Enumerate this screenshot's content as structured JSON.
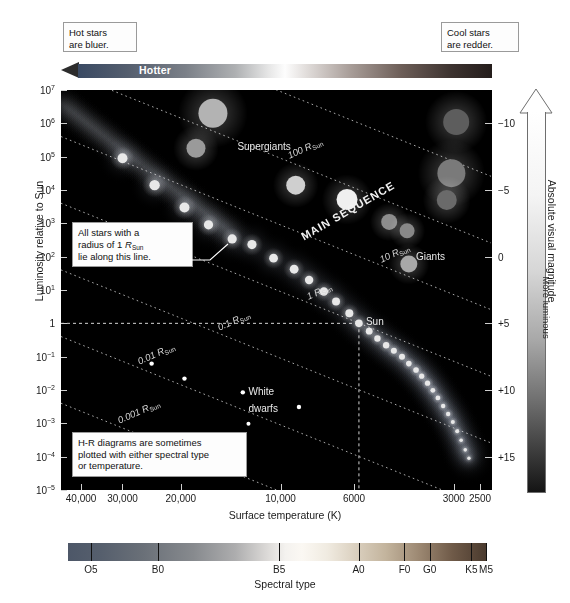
{
  "figure": {
    "kind": "hertzsprung-russell-diagram"
  },
  "annotations": {
    "hot_note": "Hot stars are blue",
    "hot_note_line1": "Hot stars",
    "hot_note_line2": "are bluer.",
    "cool_note_line1": "Cool stars",
    "cool_note_line2": "are redder.",
    "radius_note_line1": "All stars with a",
    "radius_note_line2_a": "radius of 1 ",
    "radius_note_line2_b": "R",
    "radius_note_line2_c": "Sun",
    "radius_note_line3": "lie along this line.",
    "spectral_note_line1": "H-R diagrams are sometimes",
    "spectral_note_line2": "plotted with either spectral type",
    "spectral_note_line3": "or temperature.",
    "hotter_label": "Hotter",
    "more_luminous_label": "More luminous"
  },
  "chart_data": {
    "type": "scatter",
    "xlabel": "Surface temperature (K)",
    "ylabel": "Luminosity relative to Sun",
    "y2label": "Absolute visual magnitude",
    "x_scale": "log-reversed",
    "y_scale": "log",
    "xlim": [
      46000,
      2300
    ],
    "ylim": [
      1e-05,
      10000000.0
    ],
    "grid": false,
    "x_ticks": [
      {
        "value": 40000,
        "label": "40,000"
      },
      {
        "value": 30000,
        "label": "30,000"
      },
      {
        "value": 20000,
        "label": "20,000"
      },
      {
        "value": 10000,
        "label": "10,000"
      },
      {
        "value": 6000,
        "label": "6000"
      },
      {
        "value": 3000,
        "label": "3000"
      },
      {
        "value": 2500,
        "label": "2500"
      }
    ],
    "y_ticks": [
      {
        "value": 10000000.0,
        "mant": "10",
        "exp": "7"
      },
      {
        "value": 1000000.0,
        "mant": "10",
        "exp": "6"
      },
      {
        "value": 100000.0,
        "mant": "10",
        "exp": "5"
      },
      {
        "value": 10000.0,
        "mant": "10",
        "exp": "4"
      },
      {
        "value": 1000.0,
        "mant": "10",
        "exp": "3"
      },
      {
        "value": 100.0,
        "mant": "10",
        "exp": "2"
      },
      {
        "value": 10.0,
        "mant": "10",
        "exp": "1"
      },
      {
        "value": 1,
        "mant": "1",
        "exp": ""
      },
      {
        "value": 0.1,
        "mant": "10",
        "exp": "−1"
      },
      {
        "value": 0.01,
        "mant": "10",
        "exp": "−2"
      },
      {
        "value": 0.001,
        "mant": "10",
        "exp": "−3"
      },
      {
        "value": 0.0001,
        "mant": "10",
        "exp": "−4"
      },
      {
        "value": 1e-05,
        "mant": "10",
        "exp": "−5"
      }
    ],
    "y2_ticks": [
      {
        "label": "−10",
        "lum": 1000000
      },
      {
        "label": "−5",
        "lum": 10000
      },
      {
        "label": "0",
        "lum": 100
      },
      {
        "label": "+5",
        "lum": 1
      },
      {
        "label": "+10",
        "lum": 0.01
      },
      {
        "label": "+15",
        "lum": 0.0001
      }
    ],
    "spectral_types": [
      {
        "label": "O5",
        "pos": 0.055
      },
      {
        "label": "B0",
        "pos": 0.215
      },
      {
        "label": "B5",
        "pos": 0.505
      },
      {
        "label": "A0",
        "pos": 0.695
      },
      {
        "label": "F0",
        "pos": 0.805
      },
      {
        "label": "G0",
        "pos": 0.865
      },
      {
        "label": "K5",
        "pos": 0.965
      },
      {
        "label": "M5",
        "pos": 1.0
      }
    ],
    "spectral_axis_label": "Spectral type",
    "radius_lines": [
      {
        "label": "1000",
        "unit": "R",
        "sub": "Sun",
        "radius": 1000
      },
      {
        "label": "100",
        "unit": "R",
        "sub": "Sun",
        "radius": 100
      },
      {
        "label": "10",
        "unit": "R",
        "sub": "Sun",
        "radius": 10
      },
      {
        "label": "1",
        "unit": "R",
        "sub": "Sun",
        "radius": 1
      },
      {
        "label": "0.1",
        "unit": "R",
        "sub": "Sun",
        "radius": 0.1
      },
      {
        "label": "0.01",
        "unit": "R",
        "sub": "Sun",
        "radius": 0.01
      },
      {
        "label": "0.001",
        "unit": "R",
        "sub": "Sun",
        "radius": 0.001
      }
    ],
    "region_labels": [
      {
        "name": "Supergiants",
        "temp": 13500,
        "lum": 300000
      },
      {
        "name": "Giants",
        "temp": 3900,
        "lum": 150
      },
      {
        "name": "White dwarfs_1",
        "text": "White",
        "temp": 12500,
        "lum": 0.013
      },
      {
        "name": "White dwarfs_2",
        "text": "dwarfs",
        "temp": 12500,
        "lum": 0.0042
      },
      {
        "name": "MAIN SEQUENCE",
        "temp": 8600,
        "lum": 600
      }
    ],
    "sun": {
      "label": "Sun",
      "temp": 5800,
      "lum": 1,
      "magnitude": 4.8
    },
    "series": [
      {
        "name": "supergiants",
        "color": "#b9b9b9",
        "points": [
          {
            "temp": 16000,
            "lum": 2000000,
            "r": 14.5,
            "c": "#b3b3b3"
          },
          {
            "temp": 18000,
            "lum": 180000,
            "r": 9.5,
            "c": "#9a9a9a"
          },
          {
            "temp": 2950,
            "lum": 1100000,
            "r": 13.0,
            "c": "#5d5d5d"
          },
          {
            "temp": 3050,
            "lum": 32000,
            "r": 14.0,
            "c": "#7a7a7a"
          },
          {
            "temp": 3150,
            "lum": 5000,
            "r": 10.0,
            "c": "#6a6a6a"
          },
          {
            "temp": 9000,
            "lum": 14000,
            "r": 9.5,
            "c": "#cfcfcf"
          },
          {
            "temp": 6300,
            "lum": 5200,
            "r": 10.5,
            "c": "#efefef"
          }
        ]
      },
      {
        "name": "giants",
        "color": "#9c9c9c",
        "points": [
          {
            "temp": 4700,
            "lum": 1100,
            "r": 8.0,
            "c": "#8d8d8d"
          },
          {
            "temp": 4150,
            "lum": 600,
            "r": 7.5,
            "c": "#888888"
          },
          {
            "temp": 4100,
            "lum": 60,
            "r": 8.5,
            "c": "#a8a8a8"
          }
        ]
      },
      {
        "name": "main-sequence",
        "color": "#e8e8e8",
        "points": [
          {
            "temp": 30000,
            "lum": 90000,
            "r": 5.0
          },
          {
            "temp": 24000,
            "lum": 14000,
            "r": 5.2
          },
          {
            "temp": 19500,
            "lum": 3000,
            "r": 5.0
          },
          {
            "temp": 16500,
            "lum": 900,
            "r": 4.6
          },
          {
            "temp": 14000,
            "lum": 340,
            "r": 4.6
          },
          {
            "temp": 12200,
            "lum": 230,
            "r": 4.6
          },
          {
            "temp": 10500,
            "lum": 90,
            "r": 4.4
          },
          {
            "temp": 9100,
            "lum": 42,
            "r": 4.4
          },
          {
            "temp": 8200,
            "lum": 20,
            "r": 4.2
          },
          {
            "temp": 7400,
            "lum": 9,
            "r": 4.2
          },
          {
            "temp": 6800,
            "lum": 4.5,
            "r": 4.0
          },
          {
            "temp": 6200,
            "lum": 2.0,
            "r": 4.0
          },
          {
            "temp": 5800,
            "lum": 1.0,
            "r": 3.8
          },
          {
            "temp": 5400,
            "lum": 0.58,
            "r": 3.4
          },
          {
            "temp": 5100,
            "lum": 0.35,
            "r": 3.2
          },
          {
            "temp": 4800,
            "lum": 0.22,
            "r": 3.2
          },
          {
            "temp": 4550,
            "lum": 0.15,
            "r": 3.0
          },
          {
            "temp": 4300,
            "lum": 0.1,
            "r": 3.0
          },
          {
            "temp": 4100,
            "lum": 0.062,
            "r": 2.8
          },
          {
            "temp": 3900,
            "lum": 0.04,
            "r": 2.8
          },
          {
            "temp": 3750,
            "lum": 0.026,
            "r": 2.6
          },
          {
            "temp": 3600,
            "lum": 0.016,
            "r": 2.6
          },
          {
            "temp": 3470,
            "lum": 0.0098,
            "r": 2.4
          },
          {
            "temp": 3350,
            "lum": 0.0058,
            "r": 2.4
          },
          {
            "temp": 3230,
            "lum": 0.0033,
            "r": 2.2
          },
          {
            "temp": 3120,
            "lum": 0.0019,
            "r": 2.2
          },
          {
            "temp": 3020,
            "lum": 0.0011,
            "r": 2.0
          },
          {
            "temp": 2930,
            "lum": 0.00058,
            "r": 2.0
          },
          {
            "temp": 2850,
            "lum": 0.00031,
            "r": 1.8
          },
          {
            "temp": 2770,
            "lum": 0.00016,
            "r": 1.8
          },
          {
            "temp": 2700,
            "lum": 9e-05,
            "r": 1.7
          }
        ]
      },
      {
        "name": "white-dwarfs",
        "color": "#ffffff",
        "points": [
          {
            "temp": 24500,
            "lum": 0.062,
            "r": 2.2
          },
          {
            "temp": 19500,
            "lum": 0.022,
            "r": 2.2
          },
          {
            "temp": 13000,
            "lum": 0.0085,
            "r": 2.2
          },
          {
            "temp": 8800,
            "lum": 0.0031,
            "r": 2.2
          },
          {
            "temp": 12500,
            "lum": 0.00098,
            "r": 2.0
          }
        ]
      }
    ]
  }
}
